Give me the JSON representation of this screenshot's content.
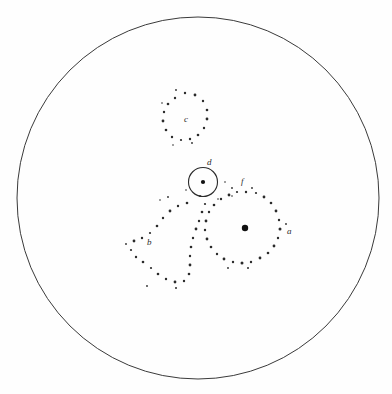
{
  "figure": {
    "background_color": "#fefefe",
    "ink_color": "#2a2a2a",
    "field": {
      "name": "field-of-view-boundary",
      "cx": 198,
      "cy": 198,
      "r": 181
    },
    "labels": {
      "a": "a",
      "b": "b",
      "c": "c",
      "d": "d",
      "f": "f"
    },
    "label_positions": {
      "a": {
        "x": 287,
        "y": 234
      },
      "b": {
        "x": 147,
        "y": 245
      },
      "c": {
        "x": 184,
        "y": 122
      },
      "d": {
        "x": 207,
        "y": 165
      },
      "f": {
        "x": 241,
        "y": 184
      }
    },
    "inner_circle": {
      "name": "circle-d",
      "cx": 203,
      "cy": 182,
      "r": 14.5,
      "center_dot_r": 2.1
    },
    "cluster_a": {
      "name": "cluster-a",
      "nucleus": {
        "x": 245,
        "y": 228,
        "r": 3.2
      },
      "dots": [
        {
          "x": 246,
          "y": 192,
          "r": 1.2
        },
        {
          "x": 256,
          "y": 193,
          "r": 1.1
        },
        {
          "x": 264,
          "y": 197,
          "r": 1.4
        },
        {
          "x": 271,
          "y": 203,
          "r": 1.3
        },
        {
          "x": 276,
          "y": 211,
          "r": 1.4
        },
        {
          "x": 279,
          "y": 220,
          "r": 1.2
        },
        {
          "x": 280,
          "y": 229,
          "r": 1.5
        },
        {
          "x": 278,
          "y": 238,
          "r": 1.2
        },
        {
          "x": 274,
          "y": 246,
          "r": 1.4
        },
        {
          "x": 268,
          "y": 253,
          "r": 1.3
        },
        {
          "x": 260,
          "y": 258,
          "r": 1.4
        },
        {
          "x": 251,
          "y": 262,
          "r": 1.2
        },
        {
          "x": 242,
          "y": 263,
          "r": 1.5
        },
        {
          "x": 233,
          "y": 262,
          "r": 1.2
        },
        {
          "x": 224,
          "y": 259,
          "r": 1.4
        },
        {
          "x": 217,
          "y": 254,
          "r": 1.2
        },
        {
          "x": 211,
          "y": 247,
          "r": 1.3
        },
        {
          "x": 207,
          "y": 239,
          "r": 1.4
        },
        {
          "x": 205,
          "y": 230,
          "r": 1.2
        },
        {
          "x": 206,
          "y": 221,
          "r": 1.4
        },
        {
          "x": 209,
          "y": 212,
          "r": 1.2
        },
        {
          "x": 214,
          "y": 205,
          "r": 1.3
        },
        {
          "x": 221,
          "y": 199,
          "r": 1.2
        },
        {
          "x": 229,
          "y": 195,
          "r": 1.4
        },
        {
          "x": 237,
          "y": 192,
          "r": 1.1
        },
        {
          "x": 232,
          "y": 188,
          "r": 0.9
        },
        {
          "x": 252,
          "y": 188,
          "r": 0.9
        },
        {
          "x": 286,
          "y": 224,
          "r": 0.9
        },
        {
          "x": 228,
          "y": 268,
          "r": 0.9
        },
        {
          "x": 248,
          "y": 268,
          "r": 1.0
        }
      ]
    },
    "cluster_b": {
      "name": "cluster-b",
      "dots": [
        {
          "x": 187,
          "y": 203,
          "r": 1.3
        },
        {
          "x": 178,
          "y": 206,
          "r": 1.2
        },
        {
          "x": 170,
          "y": 211,
          "r": 1.4
        },
        {
          "x": 163,
          "y": 218,
          "r": 1.2
        },
        {
          "x": 157,
          "y": 226,
          "r": 1.3
        },
        {
          "x": 150,
          "y": 233,
          "r": 1.1
        },
        {
          "x": 142,
          "y": 238,
          "r": 1.2
        },
        {
          "x": 134,
          "y": 241,
          "r": 1.4
        },
        {
          "x": 131,
          "y": 250,
          "r": 1.1
        },
        {
          "x": 136,
          "y": 257,
          "r": 1.2
        },
        {
          "x": 143,
          "y": 262,
          "r": 1.3
        },
        {
          "x": 151,
          "y": 268,
          "r": 1.1
        },
        {
          "x": 158,
          "y": 274,
          "r": 1.3
        },
        {
          "x": 166,
          "y": 279,
          "r": 1.2
        },
        {
          "x": 175,
          "y": 282,
          "r": 1.4
        },
        {
          "x": 184,
          "y": 281,
          "r": 1.2
        },
        {
          "x": 189,
          "y": 274,
          "r": 1.3
        },
        {
          "x": 190,
          "y": 265,
          "r": 1.4
        },
        {
          "x": 190,
          "y": 256,
          "r": 1.2
        },
        {
          "x": 191,
          "y": 247,
          "r": 1.3
        },
        {
          "x": 193,
          "y": 238,
          "r": 1.2
        },
        {
          "x": 196,
          "y": 229,
          "r": 1.4
        },
        {
          "x": 199,
          "y": 221,
          "r": 1.2
        },
        {
          "x": 202,
          "y": 212,
          "r": 1.3
        },
        {
          "x": 205,
          "y": 204,
          "r": 1.1
        },
        {
          "x": 168,
          "y": 197,
          "r": 0.9
        },
        {
          "x": 200,
          "y": 196,
          "r": 0.9
        },
        {
          "x": 126,
          "y": 244,
          "r": 0.9
        },
        {
          "x": 147,
          "y": 286,
          "r": 0.9
        },
        {
          "x": 176,
          "y": 288,
          "r": 1.0
        },
        {
          "x": 160,
          "y": 200,
          "r": 0.8
        }
      ]
    },
    "cluster_c": {
      "name": "cluster-c",
      "dots": [
        {
          "x": 185,
          "y": 93,
          "r": 1.2
        },
        {
          "x": 195,
          "y": 95,
          "r": 1.4
        },
        {
          "x": 203,
          "y": 101,
          "r": 1.2
        },
        {
          "x": 207,
          "y": 110,
          "r": 1.3
        },
        {
          "x": 207,
          "y": 119,
          "r": 1.4
        },
        {
          "x": 204,
          "y": 128,
          "r": 1.2
        },
        {
          "x": 198,
          "y": 135,
          "r": 1.3
        },
        {
          "x": 190,
          "y": 139,
          "r": 1.2
        },
        {
          "x": 181,
          "y": 140,
          "r": 1.1
        },
        {
          "x": 172,
          "y": 137,
          "r": 1.2
        },
        {
          "x": 166,
          "y": 130,
          "r": 1.3
        },
        {
          "x": 163,
          "y": 121,
          "r": 1.4
        },
        {
          "x": 164,
          "y": 112,
          "r": 1.2
        },
        {
          "x": 168,
          "y": 104,
          "r": 1.3
        },
        {
          "x": 175,
          "y": 98,
          "r": 1.2
        },
        {
          "x": 176,
          "y": 90,
          "r": 0.9
        },
        {
          "x": 162,
          "y": 103,
          "r": 0.8
        },
        {
          "x": 192,
          "y": 143,
          "r": 0.9
        },
        {
          "x": 173,
          "y": 145,
          "r": 0.8
        }
      ]
    },
    "stray_dots": [
      {
        "x": 225,
        "y": 182,
        "r": 0.8
      },
      {
        "x": 232,
        "y": 196,
        "r": 0.8
      },
      {
        "x": 218,
        "y": 199,
        "r": 0.8
      },
      {
        "x": 186,
        "y": 190,
        "r": 0.8
      }
    ]
  }
}
